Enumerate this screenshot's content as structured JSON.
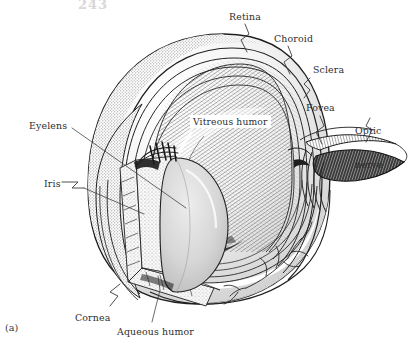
{
  "figure": {
    "index_label": "(a)",
    "page_header": "243",
    "background_color": "#ffffff",
    "ink_color": "#2b2b2b"
  },
  "labels": [
    {
      "id": "retina",
      "name": "Retina",
      "x": 229,
      "y": 11,
      "lines": [
        "Retina"
      ]
    },
    {
      "id": "choroid",
      "name": "Choroid",
      "x": 274,
      "y": 33,
      "lines": [
        "Choroid"
      ]
    },
    {
      "id": "sclera",
      "name": "Sclera",
      "x": 313,
      "y": 64,
      "lines": [
        "Sclera"
      ]
    },
    {
      "id": "fovea",
      "name": "Fovea",
      "x": 306,
      "y": 102,
      "lines": [
        "Fovea"
      ]
    },
    {
      "id": "optic-nerve",
      "name": "Optic nerve",
      "x": 355,
      "y": 102,
      "lines": [
        "Optic",
        "nerve"
      ]
    },
    {
      "id": "vitreous-humor",
      "name": "Vitreous humor",
      "x": 190,
      "y": 115,
      "lines": [
        "Vitreous humor"
      ]
    },
    {
      "id": "eyelens",
      "name": "Eyelens",
      "x": 29,
      "y": 120,
      "lines": [
        "Eyelens"
      ]
    },
    {
      "id": "iris",
      "name": "Iris",
      "x": 44,
      "y": 178,
      "lines": [
        "Iris"
      ]
    },
    {
      "id": "cornea",
      "name": "Cornea",
      "x": 75,
      "y": 312,
      "lines": [
        "Cornea"
      ]
    },
    {
      "id": "aqueous-humor",
      "name": "Aqueous humor",
      "x": 117,
      "y": 326,
      "lines": [
        "Aqueous humor"
      ]
    }
  ],
  "anatomy_parts": [
    {
      "id": "sclera-shell",
      "label": "Sclera",
      "appearance": "stippled gray outer shell"
    },
    {
      "id": "choroid-layer",
      "label": "Choroid",
      "appearance": "thin concentric arc"
    },
    {
      "id": "retina-layer",
      "label": "Retina",
      "appearance": "innermost concentric arc"
    },
    {
      "id": "vitreous-body",
      "label": "Vitreous humor",
      "appearance": "diagonal hatched dome"
    },
    {
      "id": "eyelens-body",
      "label": "Eyelens",
      "appearance": "gray ellipse"
    },
    {
      "id": "aqueous-chamber",
      "label": "Aqueous humor",
      "appearance": "stippled wedge chamber"
    },
    {
      "id": "iris-body",
      "label": "Iris",
      "appearance": "dark diaphragm edge"
    },
    {
      "id": "cornea-dome",
      "label": "Cornea",
      "appearance": "outer clear dome"
    },
    {
      "id": "fovea-pit",
      "label": "Fovea",
      "appearance": "small pit on retina"
    },
    {
      "id": "optic-nerve-bundle",
      "label": "Optic nerve",
      "appearance": "dark striated bundle"
    },
    {
      "id": "blood-vessels",
      "label": "Blood vessels",
      "appearance": "branching lines on sclera"
    }
  ]
}
